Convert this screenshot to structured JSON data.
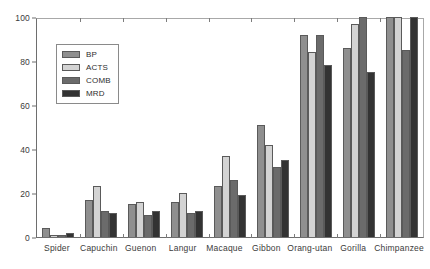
{
  "chart_data": {
    "type": "bar",
    "title": "",
    "xlabel": "",
    "ylabel": "",
    "ylim": [
      0,
      100
    ],
    "yticks": [
      0,
      20,
      40,
      60,
      80,
      100
    ],
    "grid": false,
    "legend_position": "upper-left-inside",
    "categories": [
      "Spider",
      "Capuchin",
      "Guenon",
      "Langur",
      "Macaque",
      "Gibbon",
      "Orang-utan",
      "Gorilla",
      "Chimpanzee"
    ],
    "series": [
      {
        "name": "BP",
        "color": "#8f8f8f",
        "values": [
          4,
          17,
          15,
          16,
          23,
          51,
          92,
          86,
          100
        ]
      },
      {
        "name": "ACTS",
        "color": "#d3d3d3",
        "values": [
          1,
          23,
          16,
          20,
          37,
          42,
          84,
          97,
          100
        ]
      },
      {
        "name": "COMB",
        "color": "#6b6b6b",
        "values": [
          1,
          12,
          10,
          11,
          26,
          32,
          92,
          100,
          85
        ]
      },
      {
        "name": "MRD",
        "color": "#333333",
        "values": [
          2,
          11,
          12,
          12,
          19,
          35,
          78,
          75,
          100
        ]
      }
    ]
  }
}
